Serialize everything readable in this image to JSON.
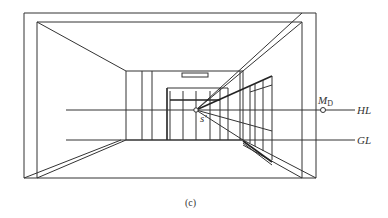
{
  "figure": {
    "caption": "(c)",
    "labels": {
      "vanishing_point": "s'",
      "measuring_point_main": "M",
      "measuring_point_sub": "D",
      "horizon_line": "HL",
      "ground_line": "GL"
    }
  }
}
